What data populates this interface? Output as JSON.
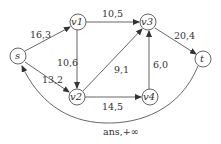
{
  "graph": {
    "nodes": [
      {
        "id": "s",
        "label": "s"
      },
      {
        "id": "v1",
        "label": "v1"
      },
      {
        "id": "v2",
        "label": "v2"
      },
      {
        "id": "v3",
        "label": "v3"
      },
      {
        "id": "v4",
        "label": "v4"
      },
      {
        "id": "t",
        "label": "t"
      }
    ],
    "edges": [
      {
        "from": "s",
        "to": "v1",
        "label": "16,3"
      },
      {
        "from": "s",
        "to": "v2",
        "label": "13,2"
      },
      {
        "from": "v1",
        "to": "v3",
        "label": "10,5"
      },
      {
        "from": "v1",
        "to": "v2",
        "label": "10,6"
      },
      {
        "from": "v2",
        "to": "v3",
        "label": "9,1"
      },
      {
        "from": "v2",
        "to": "v4",
        "label": "14,5"
      },
      {
        "from": "v4",
        "to": "v3",
        "label": "6,0"
      },
      {
        "from": "v3",
        "to": "t",
        "label": "20,4"
      },
      {
        "from": "t",
        "to": "s",
        "label": "ans,+∞"
      }
    ]
  }
}
